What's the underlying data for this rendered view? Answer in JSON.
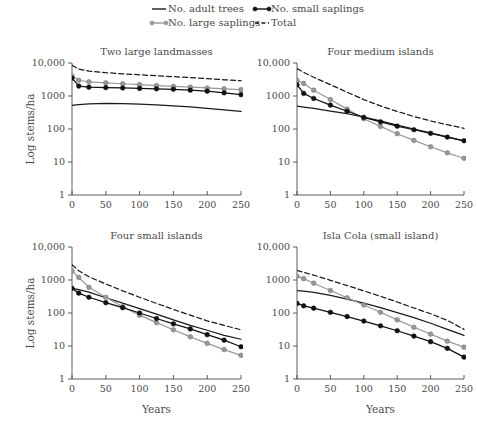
{
  "figure": {
    "width": 477,
    "height": 428,
    "background": "#ffffff",
    "axis_color": "#4a4a4a",
    "text_color": "#4a4a4a"
  },
  "legend": {
    "position": "top",
    "entries": [
      {
        "label": "No. adult trees",
        "style": "solid",
        "color": "#1a1a1a",
        "markers": false,
        "icon": "solid-line-icon"
      },
      {
        "label": "No. large saplings",
        "style": "solid",
        "color": "#999999",
        "markers": true,
        "icon": "gray-line-marker-icon"
      },
      {
        "label": "No. small saplings",
        "style": "solid",
        "color": "#111111",
        "markers": true,
        "icon": "black-line-marker-icon"
      },
      {
        "label": "Total",
        "style": "dashed",
        "color": "#1a1a1a",
        "markers": false,
        "icon": "dashed-line-icon"
      }
    ]
  },
  "axes": {
    "xlabel": "Years",
    "ylabel": "Log stems/ha",
    "xticks": [
      0,
      50,
      100,
      150,
      200,
      250
    ],
    "xtick_labels": [
      "0",
      "50",
      "100",
      "150",
      "200",
      "250"
    ],
    "xlim": [
      0,
      250
    ],
    "yticks": [
      1,
      10,
      100,
      1000,
      10000
    ],
    "ytick_labels": [
      "1",
      "10",
      "100",
      "1000",
      "10,000"
    ],
    "ylim": [
      1,
      10000
    ],
    "yscale": "log",
    "grid": false
  },
  "chart_data": [
    {
      "type": "line",
      "title": "Two large landmasses",
      "panel": "top-left",
      "xlabel": "",
      "ylabel": "Log stems/ha",
      "xlim": [
        0,
        250
      ],
      "ylim": [
        1,
        10000
      ],
      "yscale": "log",
      "grid": false,
      "x": [
        0,
        10,
        25,
        50,
        75,
        100,
        125,
        150,
        175,
        200,
        225,
        250
      ],
      "series": [
        {
          "name": "No. adult trees",
          "color": "#1a1a1a",
          "style": "solid",
          "markers": false,
          "values": [
            520,
            545,
            580,
            600,
            590,
            570,
            540,
            505,
            465,
            425,
            380,
            340
          ]
        },
        {
          "name": "No. large saplings",
          "color": "#999999",
          "style": "solid",
          "markers": true,
          "values": [
            4000,
            3000,
            2700,
            2500,
            2350,
            2200,
            2050,
            1950,
            1850,
            1750,
            1650,
            1550
          ]
        },
        {
          "name": "No. small saplings",
          "color": "#111111",
          "style": "solid",
          "markers": true,
          "values": [
            3500,
            2000,
            1850,
            1800,
            1750,
            1700,
            1650,
            1600,
            1500,
            1400,
            1250,
            1100
          ]
        },
        {
          "name": "Total",
          "color": "#1a1a1a",
          "style": "dashed",
          "markers": false,
          "values": [
            8500,
            6500,
            5700,
            5100,
            4700,
            4400,
            4100,
            3850,
            3600,
            3350,
            3100,
            2900
          ]
        }
      ]
    },
    {
      "type": "line",
      "title": "Four medium islands",
      "panel": "top-right",
      "xlabel": "",
      "ylabel": "",
      "xlim": [
        0,
        250
      ],
      "ylim": [
        1,
        10000
      ],
      "yscale": "log",
      "grid": false,
      "x": [
        0,
        10,
        25,
        50,
        75,
        100,
        125,
        150,
        175,
        200,
        225,
        250
      ],
      "series": [
        {
          "name": "No. adult trees",
          "color": "#1a1a1a",
          "style": "solid",
          "markers": false,
          "values": [
            490,
            460,
            420,
            350,
            290,
            230,
            175,
            132,
            100,
            76,
            58,
            44
          ]
        },
        {
          "name": "No. large saplings",
          "color": "#999999",
          "style": "solid",
          "markers": true,
          "values": [
            3000,
            2400,
            1500,
            780,
            400,
            205,
            120,
            72,
            45,
            29,
            19,
            13
          ]
        },
        {
          "name": "No. small saplings",
          "color": "#111111",
          "style": "solid",
          "markers": true,
          "values": [
            2200,
            1200,
            840,
            530,
            345,
            225,
            165,
            122,
            95,
            74,
            57,
            44
          ]
        },
        {
          "name": "Total",
          "color": "#1a1a1a",
          "style": "dashed",
          "markers": false,
          "values": [
            6800,
            5200,
            3700,
            2200,
            1300,
            780,
            500,
            340,
            240,
            175,
            135,
            105
          ]
        }
      ]
    },
    {
      "type": "line",
      "title": "Four small islands",
      "panel": "bottom-left",
      "xlabel": "Years",
      "ylabel": "Log stems/ha",
      "xlim": [
        0,
        250
      ],
      "ylim": [
        1,
        10000
      ],
      "yscale": "log",
      "grid": false,
      "x": [
        0,
        10,
        25,
        50,
        75,
        100,
        125,
        150,
        175,
        200,
        225,
        250
      ],
      "series": [
        {
          "name": "No. adult trees",
          "color": "#1a1a1a",
          "style": "solid",
          "markers": false,
          "values": [
            560,
            510,
            430,
            290,
            200,
            135,
            92,
            62,
            42,
            30,
            21,
            16
          ]
        },
        {
          "name": "No. large saplings",
          "color": "#999999",
          "style": "solid",
          "markers": true,
          "values": [
            1900,
            1200,
            600,
            300,
            155,
            86,
            51,
            31,
            19,
            12,
            7.8,
            5.2
          ]
        },
        {
          "name": "No. small saplings",
          "color": "#111111",
          "style": "solid",
          "markers": true,
          "values": [
            560,
            400,
            300,
            205,
            145,
            100,
            68,
            47,
            33,
            22,
            15,
            9.5
          ]
        },
        {
          "name": "Total",
          "color": "#1a1a1a",
          "style": "dashed",
          "markers": false,
          "values": [
            2900,
            1900,
            1250,
            760,
            470,
            300,
            195,
            128,
            86,
            58,
            42,
            31
          ]
        }
      ]
    },
    {
      "type": "line",
      "title": "Isla Cola (small island)",
      "panel": "bottom-right",
      "xlabel": "Years",
      "ylabel": "",
      "xlim": [
        0,
        250
      ],
      "ylim": [
        1,
        10000
      ],
      "yscale": "log",
      "grid": false,
      "x": [
        0,
        10,
        25,
        50,
        75,
        100,
        125,
        150,
        175,
        200,
        225,
        250
      ],
      "series": [
        {
          "name": "No. adult trees",
          "color": "#1a1a1a",
          "style": "solid",
          "markers": false,
          "values": [
            480,
            460,
            420,
            340,
            265,
            200,
            145,
            103,
            72,
            49,
            32,
            21
          ]
        },
        {
          "name": "No. large saplings",
          "color": "#999999",
          "style": "solid",
          "markers": true,
          "values": [
            1300,
            1100,
            800,
            480,
            290,
            175,
            105,
            62,
            37,
            23,
            14,
            9.2
          ]
        },
        {
          "name": "No. small saplings",
          "color": "#111111",
          "style": "solid",
          "markers": true,
          "values": [
            195,
            165,
            140,
            105,
            78,
            57,
            41,
            29,
            20,
            13.5,
            8.5,
            4.6
          ]
        },
        {
          "name": "Total",
          "color": "#1a1a1a",
          "style": "dashed",
          "markers": false,
          "values": [
            1950,
            1700,
            1400,
            980,
            680,
            470,
            320,
            215,
            142,
            95,
            60,
            32
          ]
        }
      ]
    }
  ]
}
